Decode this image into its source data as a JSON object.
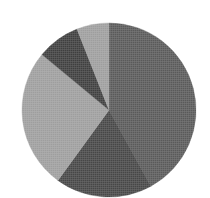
{
  "figure": {
    "kind": "pie-chart",
    "background_color": "#ffffff",
    "rendering": "grayscale halftone scan",
    "title": "",
    "has_labels": false,
    "has_legend": false,
    "cropped_bottom": true
  },
  "geometry": {
    "center_x": 109,
    "center_y": 110,
    "radius": 87,
    "start_angle_deg": 0,
    "direction": "clockwise"
  },
  "chart_data": {
    "type": "pie",
    "title": "",
    "xlabel": "",
    "ylabel": "",
    "legend": "none",
    "grid": false,
    "labels": [
      "Slice 1",
      "Slice 2",
      "Slice 3",
      "Slice 4",
      "Slice 5"
    ],
    "values": [
      42,
      18,
      26,
      8,
      6
    ],
    "units": "percent",
    "total": 100,
    "colors": [
      "#5a5a5a",
      "#474747",
      "#9e9e9e",
      "#3f3f3f",
      "#9e9e9e"
    ],
    "slices": [
      {
        "name": "Slice 1",
        "value": 42,
        "percent": "42%",
        "color": "#5a5a5a",
        "start_angle": 0,
        "end_angle": 151.2,
        "position": "right"
      },
      {
        "name": "Slice 2",
        "value": 18,
        "percent": "18%",
        "color": "#474747",
        "start_angle": 151.2,
        "end_angle": 216.0,
        "position": "bottom-left"
      },
      {
        "name": "Slice 3",
        "value": 26,
        "percent": "26%",
        "color": "#9e9e9e",
        "start_angle": 216.0,
        "end_angle": 309.6,
        "position": "left"
      },
      {
        "name": "Slice 4",
        "value": 8,
        "percent": "8%",
        "color": "#3f3f3f",
        "start_angle": 309.6,
        "end_angle": 338.4,
        "position": "upper-left"
      },
      {
        "name": "Slice 5",
        "value": 6,
        "percent": "6%",
        "color": "#9e9e9e",
        "start_angle": 338.4,
        "end_angle": 360.0,
        "position": "top"
      }
    ]
  }
}
